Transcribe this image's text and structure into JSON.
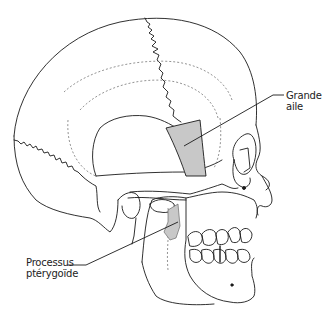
{
  "diagram": {
    "labels": [
      {
        "id": "grande-aile",
        "lines": [
          "Grande",
          "aile"
        ]
      },
      {
        "id": "processus-pterygoide",
        "lines": [
          "Processus",
          "ptérygoïde"
        ]
      }
    ],
    "colors": {
      "line": "#1a1a1a",
      "highlight_fill": "#c8c8c8",
      "background": "#ffffff",
      "dashed": "#777777"
    }
  }
}
